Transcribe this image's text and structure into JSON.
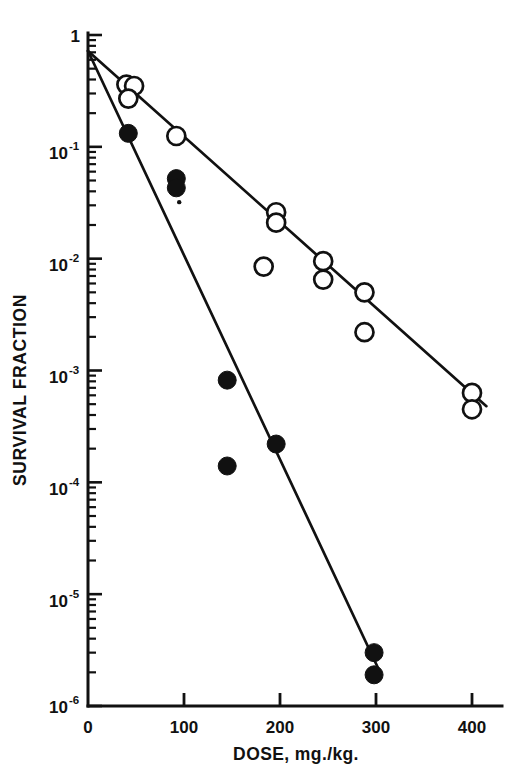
{
  "chart_data": {
    "type": "scatter",
    "title": "",
    "subtitle": "",
    "xlabel": "DOSE, mg./kg.",
    "ylabel": "SURVIVAL FRACTION",
    "xscale": "linear",
    "yscale": "log",
    "xlim": [
      0,
      420
    ],
    "ylim": [
      1e-06,
      1
    ],
    "grid": false,
    "legend": "none",
    "xticks": [
      0,
      100,
      200,
      300,
      400
    ],
    "xticklabels": [
      "0",
      "100",
      "200",
      "300",
      "400"
    ],
    "yticks": [
      1,
      0.1,
      0.01,
      0.001,
      0.0001,
      1e-05,
      1e-06
    ],
    "yticklabels": [
      "1",
      "10⁻¹",
      "10⁻²",
      "10⁻³",
      "10⁻⁴",
      "10⁻⁵",
      "10⁻⁶"
    ],
    "ytick_mantissas": [
      "1",
      "10",
      "10",
      "10",
      "10",
      "10",
      "10"
    ],
    "ytick_exponents": [
      "",
      "-1",
      "-2",
      "-3",
      "-4",
      "-5",
      "-6"
    ],
    "minor_ticks": true,
    "series": [
      {
        "name": "open-circles",
        "marker": "open-circle",
        "marker_size": 9,
        "color": "#111111",
        "fill": "#ffffff",
        "points": [
          {
            "x": 40,
            "y": 0.36
          },
          {
            "x": 48,
            "y": 0.35
          },
          {
            "x": 42,
            "y": 0.27
          },
          {
            "x": 92,
            "y": 0.125
          },
          {
            "x": 196,
            "y": 0.026
          },
          {
            "x": 196,
            "y": 0.021
          },
          {
            "x": 183,
            "y": 0.0085
          },
          {
            "x": 245,
            "y": 0.0095
          },
          {
            "x": 245,
            "y": 0.0065
          },
          {
            "x": 288,
            "y": 0.005
          },
          {
            "x": 288,
            "y": 0.0022
          },
          {
            "x": 400,
            "y": 0.00063
          },
          {
            "x": 400,
            "y": 0.00045
          }
        ],
        "fit_line": {
          "x0": 0,
          "y0": 0.72,
          "x1": 415,
          "y1": 0.00048
        }
      },
      {
        "name": "filled-circles",
        "marker": "filled-circle",
        "marker_size": 9,
        "color": "#111111",
        "fill": "#111111",
        "points": [
          {
            "x": 42,
            "y": 0.132
          },
          {
            "x": 92,
            "y": 0.052
          },
          {
            "x": 92,
            "y": 0.043
          },
          {
            "x": 145,
            "y": 0.00082
          },
          {
            "x": 145,
            "y": 0.00014
          },
          {
            "x": 196,
            "y": 0.00022
          },
          {
            "x": 298,
            "y": 3e-06
          },
          {
            "x": 298,
            "y": 1.9e-06
          }
        ],
        "small_dot": {
          "x": 95,
          "y": 0.032,
          "size": 2.2
        },
        "fit_line": {
          "x0": 0,
          "y0": 0.72,
          "x1": 302,
          "y1": 2.2e-06
        }
      }
    ]
  },
  "axes": {
    "y_axis_label": "SURVIVAL FRACTION",
    "x_axis_label": "DOSE, mg./kg."
  }
}
